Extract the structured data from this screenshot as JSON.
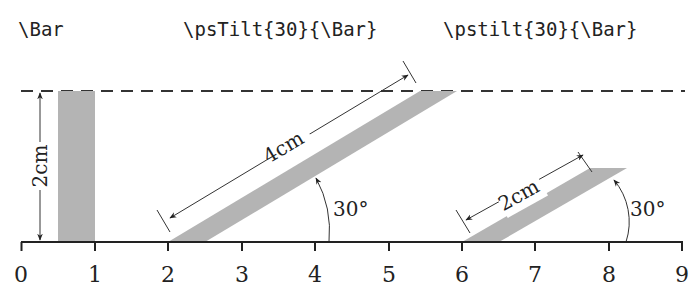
{
  "headings": {
    "bar": "\\Bar",
    "pstilt_upper": "\\psTilt{30}{\\Bar}",
    "pstilt_lower": "\\pstilt{30}{\\Bar}"
  },
  "axis": {
    "ticks": [
      "0",
      "1",
      "2",
      "3",
      "4",
      "5",
      "6",
      "7",
      "8",
      "9"
    ]
  },
  "labels": {
    "height": "2cm",
    "tilt_length_upper": "4cm",
    "tilt_length_lower": "2cm",
    "angle_upper": "30°",
    "angle_lower": "30°"
  },
  "colors": {
    "bar_fill": "#b4b4b4",
    "line": "#222222"
  }
}
